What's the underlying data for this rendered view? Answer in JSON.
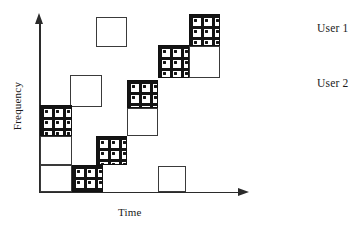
{
  "figure": {
    "axes": {
      "x_label": "Time",
      "y_label": "Frequency",
      "x_axis_name": "time-axis",
      "y_axis_name": "frequency-axis"
    },
    "legend": {
      "entries": [
        {
          "label": "User 1",
          "fill": "empty",
          "color": "#ffffff"
        },
        {
          "label": "User 2",
          "fill": "crosshatch",
          "color": "#141414"
        }
      ]
    }
  },
  "chart_data": {
    "type": "scatter",
    "title": "",
    "xlabel": "Time",
    "ylabel": "Frequency",
    "grid": false,
    "legend_position": "right",
    "xlim": [
      0,
      1
    ],
    "ylim": [
      0,
      1
    ],
    "series": [
      {
        "name": "User 1",
        "fill": "empty",
        "tiles": [
          {
            "x": 96,
            "y": 17,
            "w": 31,
            "h": 30
          },
          {
            "x": 70,
            "y": 75,
            "w": 32,
            "h": 32
          },
          {
            "x": 127,
            "y": 108,
            "w": 31,
            "h": 28
          },
          {
            "x": 189,
            "y": 46,
            "w": 31,
            "h": 32
          },
          {
            "x": 40,
            "y": 136,
            "w": 32,
            "h": 29
          },
          {
            "x": 40,
            "y": 165,
            "w": 32,
            "h": 27
          },
          {
            "x": 158,
            "y": 166,
            "w": 28,
            "h": 26
          }
        ]
      },
      {
        "name": "User 2",
        "fill": "crosshatch",
        "tiles": [
          {
            "x": 189,
            "y": 14,
            "w": 31,
            "h": 32
          },
          {
            "x": 158,
            "y": 45,
            "w": 31,
            "h": 33
          },
          {
            "x": 127,
            "y": 80,
            "w": 31,
            "h": 28
          },
          {
            "x": 40,
            "y": 105,
            "w": 32,
            "h": 31
          },
          {
            "x": 96,
            "y": 136,
            "w": 31,
            "h": 29
          },
          {
            "x": 72,
            "y": 165,
            "w": 31,
            "h": 27
          }
        ]
      }
    ]
  }
}
